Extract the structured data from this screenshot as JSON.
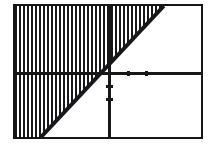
{
  "screen": {
    "title": "Graphing calculator plot",
    "frame_color": "#17171a",
    "background_color": "#ffffff",
    "ink_color": "#17171a"
  },
  "chart_data": {
    "type": "line",
    "title": "",
    "subtitle": "",
    "xlabel": "",
    "ylabel": "",
    "grid": false,
    "legend_position": "none",
    "description": "Linear inequality graph: a solid boundary line with the half-plane to its left shaded with vertical hatch lines.",
    "xlim": [
      -10,
      10
    ],
    "ylim": [
      -10,
      10
    ],
    "x_ticks": [
      -10,
      -8,
      -6,
      -4,
      -2,
      0,
      2,
      4,
      6,
      8,
      10
    ],
    "y_ticks": [
      -10,
      -8,
      -6,
      -4,
      -2,
      0,
      2,
      4,
      6,
      8,
      10
    ],
    "x_tick_labels": [],
    "y_tick_labels": [],
    "axes": {
      "x_axis_y_value": 0,
      "y_axis_x_value": 0,
      "x_axis_visible": true,
      "y_axis_visible": true
    },
    "series": [
      {
        "name": "boundary-line",
        "type": "line",
        "style": "solid",
        "color": "#17171a",
        "x": [
          -7.2,
          6.0
        ],
        "y": [
          -10.0,
          10.0
        ],
        "slope": 1.5,
        "intercept": 0.8
      }
    ],
    "shading": {
      "region": "left-of-line",
      "pattern": "vertical-hatch",
      "pattern_period_px": 4,
      "color": "#17171a"
    },
    "visible_tick_marks": {
      "x_positive": [
        2,
        4
      ],
      "y_negative": [
        -2,
        -4
      ]
    }
  }
}
